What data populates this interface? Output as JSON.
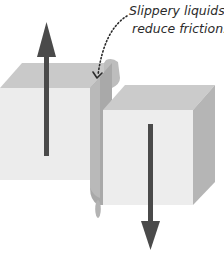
{
  "diagram": {
    "annotation": {
      "line1": "Slippery liquids",
      "line2": "reduce friction."
    },
    "elements": {
      "left_block": {
        "label": "block moving up",
        "force_direction": "up"
      },
      "right_block": {
        "label": "block moving down",
        "force_direction": "down"
      },
      "liquid_layer": {
        "label": "lubricating liquid between blocks"
      },
      "droplet": {
        "label": "liquid droplet"
      }
    },
    "colors": {
      "background": "#ffffff",
      "block_front": "#ececec",
      "block_top": "#c9c9c9",
      "block_side": "#b5b5b5",
      "liquid": "#a8a8a8",
      "liquid_light": "#bdbdbd",
      "arrow": "#4a4a4a",
      "text": "#2b2b2b"
    }
  }
}
